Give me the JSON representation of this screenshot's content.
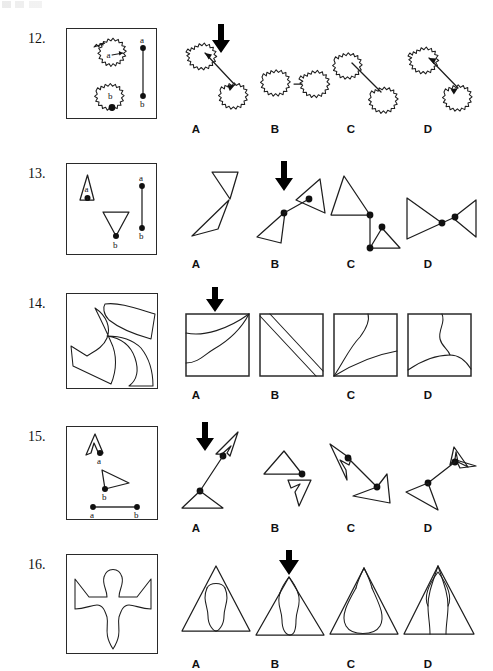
{
  "page": {
    "width": 493,
    "height": 671,
    "background": "#ffffff",
    "ink_color": "#1d1d1d",
    "scan_artifact_present": true
  },
  "option_letters": [
    "A",
    "B",
    "C",
    "D"
  ],
  "point_labels": {
    "a": "a",
    "b": "b"
  },
  "items": [
    {
      "number": "12.",
      "stimulus": {
        "description": "Two blob shapes with wavy scalloped outlines; point a on right edge of upper blob, point b at bottom of lower blob; separate reference segment a-b shown vertically",
        "labels": [
          "a",
          "b",
          "a",
          "b"
        ]
      },
      "options": [
        "A",
        "B",
        "C",
        "D"
      ],
      "correct": "A",
      "arrow_on": "A"
    },
    {
      "number": "13.",
      "stimulus": {
        "description": "Upward triangle with point a inside, downward triangle with point b at its bottom vertex; reference segment a-b shown vertically",
        "labels": [
          "a",
          "b",
          "a",
          "b"
        ]
      },
      "options": [
        "A",
        "B",
        "C",
        "D"
      ],
      "correct": "B",
      "arrow_on": "B"
    },
    {
      "number": "14.",
      "stimulus": {
        "description": "Large square containing overlapping curved and straight-edged surfaces; options are small squares with curve patterns",
        "labels": []
      },
      "options": [
        "A",
        "B",
        "C",
        "D"
      ],
      "correct": "A",
      "arrow_on": "A"
    },
    {
      "number": "15.",
      "stimulus": {
        "description": "Narrow hollow arrowhead shape with point a, open triangle with point b; reference segment a-b shown horizontally",
        "labels": [
          "a",
          "b",
          "a",
          "b"
        ]
      },
      "options": [
        "A",
        "B",
        "C",
        "D"
      ],
      "correct": "A",
      "arrow_on": "A"
    },
    {
      "number": "16.",
      "stimulus": {
        "description": "Bird/anchor-like flat figure with two wings and a downward pointed tail; options are triangles with the figure folded inside",
        "labels": []
      },
      "options": [
        "A",
        "B",
        "C",
        "D"
      ],
      "correct": "B",
      "arrow_on": "B"
    }
  ]
}
